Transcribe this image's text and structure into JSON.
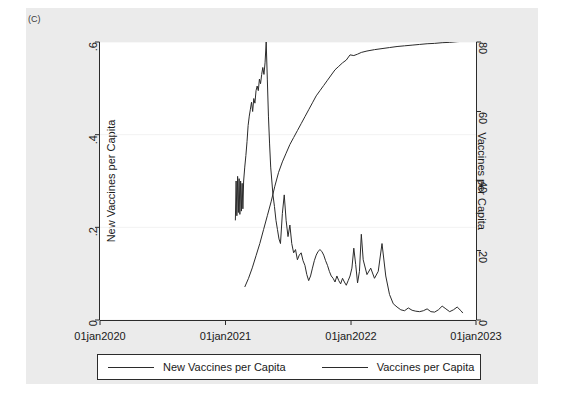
{
  "figure": {
    "panel_label": "(C)",
    "background_color": "#ebebeb",
    "plot_background_color": "#ffffff",
    "line_color": "#2b2b2b"
  },
  "legend": {
    "entries": [
      {
        "label": "New Vaccines per Capita",
        "icon": "line-swatch-icon"
      },
      {
        "label": "Vaccines per Capita",
        "icon": "line-swatch-icon"
      }
    ]
  },
  "chart_data": {
    "type": "line",
    "title": "",
    "subtitle": "",
    "xlabel": "",
    "ylabel": "New Vaccines per Capita",
    "y2label": "Vaccines per Capita",
    "grid": true,
    "grid_axis": "y",
    "legend_position": "bottom",
    "xlim": [
      "01jan2020",
      "01jan2023"
    ],
    "x_tick_labels": [
      "01jan2020",
      "01jan2021",
      "01jan2022",
      "01jan2023"
    ],
    "x_tick_positions": [
      0.0,
      0.3338,
      0.6676,
      1.0
    ],
    "ylim": [
      0,
      0.6
    ],
    "y_tick_labels": [
      "0",
      ".2",
      ".4",
      ".6"
    ],
    "y_tick_values": [
      0,
      0.2,
      0.4,
      0.6
    ],
    "y2lim": [
      0,
      80
    ],
    "y2_tick_labels": [
      "0",
      "20",
      "40",
      "60",
      "80"
    ],
    "y2_tick_values": [
      0,
      20,
      40,
      60,
      80
    ],
    "series": [
      {
        "name": "New Vaccines per Capita",
        "axis": "left",
        "unit": "doses per capita per period",
        "x": [
          0.36,
          0.362,
          0.364,
          0.366,
          0.368,
          0.37,
          0.372,
          0.374,
          0.376,
          0.378,
          0.38,
          0.382,
          0.385,
          0.388,
          0.391,
          0.394,
          0.397,
          0.4,
          0.403,
          0.406,
          0.409,
          0.412,
          0.415,
          0.418,
          0.421,
          0.424,
          0.427,
          0.43,
          0.433,
          0.436,
          0.439,
          0.442,
          0.445,
          0.448,
          0.451,
          0.454,
          0.457,
          0.46,
          0.464,
          0.468,
          0.472,
          0.476,
          0.48,
          0.485,
          0.49,
          0.495,
          0.5,
          0.505,
          0.51,
          0.515,
          0.52,
          0.525,
          0.53,
          0.535,
          0.54,
          0.545,
          0.55,
          0.555,
          0.56,
          0.565,
          0.57,
          0.575,
          0.58,
          0.585,
          0.59,
          0.595,
          0.6,
          0.605,
          0.61,
          0.615,
          0.62,
          0.625,
          0.63,
          0.635,
          0.64,
          0.645,
          0.65,
          0.655,
          0.66,
          0.665,
          0.67,
          0.675,
          0.68,
          0.685,
          0.69,
          0.695,
          0.7,
          0.71,
          0.72,
          0.73,
          0.74,
          0.75,
          0.76,
          0.77,
          0.78,
          0.79,
          0.8,
          0.81,
          0.82,
          0.83,
          0.84,
          0.85,
          0.86,
          0.87,
          0.88,
          0.89,
          0.9,
          0.91,
          0.92,
          0.93,
          0.94,
          0.95,
          0.96,
          0.965
        ],
        "y": [
          0.215,
          0.3,
          0.225,
          0.31,
          0.232,
          0.305,
          0.228,
          0.3,
          0.235,
          0.295,
          0.24,
          0.3,
          0.33,
          0.355,
          0.385,
          0.42,
          0.44,
          0.455,
          0.47,
          0.45,
          0.478,
          0.468,
          0.495,
          0.505,
          0.495,
          0.52,
          0.51,
          0.53,
          0.545,
          0.53,
          0.555,
          0.6,
          0.52,
          0.44,
          0.38,
          0.33,
          0.3,
          0.27,
          0.245,
          0.215,
          0.195,
          0.175,
          0.165,
          0.23,
          0.27,
          0.215,
          0.18,
          0.205,
          0.165,
          0.145,
          0.152,
          0.13,
          0.14,
          0.145,
          0.128,
          0.118,
          0.098,
          0.085,
          0.095,
          0.112,
          0.128,
          0.14,
          0.148,
          0.152,
          0.148,
          0.14,
          0.128,
          0.118,
          0.105,
          0.095,
          0.09,
          0.082,
          0.095,
          0.085,
          0.078,
          0.09,
          0.082,
          0.075,
          0.085,
          0.095,
          0.112,
          0.155,
          0.12,
          0.08,
          0.105,
          0.185,
          0.13,
          0.098,
          0.112,
          0.09,
          0.105,
          0.165,
          0.095,
          0.055,
          0.035,
          0.028,
          0.022,
          0.02,
          0.026,
          0.021,
          0.019,
          0.018,
          0.02,
          0.024,
          0.018,
          0.017,
          0.022,
          0.03,
          0.024,
          0.018,
          0.022,
          0.028,
          0.02,
          0.015
        ]
      },
      {
        "name": "Vaccines per Capita",
        "axis": "right",
        "unit": "cumulative doses per 100 people",
        "x": [
          0.385,
          0.395,
          0.405,
          0.415,
          0.425,
          0.435,
          0.445,
          0.455,
          0.465,
          0.475,
          0.485,
          0.495,
          0.505,
          0.515,
          0.525,
          0.535,
          0.545,
          0.555,
          0.565,
          0.575,
          0.585,
          0.595,
          0.605,
          0.615,
          0.625,
          0.635,
          0.645,
          0.655,
          0.665,
          0.675,
          0.685,
          0.695,
          0.71,
          0.73,
          0.75,
          0.77,
          0.79,
          0.81,
          0.83,
          0.85,
          0.87,
          0.89,
          0.91,
          0.93,
          0.95,
          0.965
        ],
        "y": [
          9.5,
          12.0,
          15.0,
          18.5,
          22.0,
          26.0,
          30.0,
          34.0,
          38.5,
          42.5,
          45.5,
          48.0,
          50.5,
          52.5,
          54.5,
          56.5,
          58.5,
          60.5,
          62.5,
          64.5,
          66.0,
          67.5,
          69.0,
          70.5,
          72.0,
          73.0,
          74.0,
          74.8,
          76.3,
          76.1,
          76.5,
          77.0,
          77.4,
          77.8,
          78.1,
          78.4,
          78.7,
          78.9,
          79.1,
          79.3,
          79.5,
          79.6,
          79.8,
          79.9,
          80.1,
          80.2
        ]
      }
    ]
  }
}
